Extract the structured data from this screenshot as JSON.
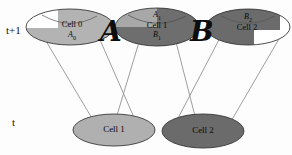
{
  "diagram": {
    "type": "cell-lineage-cone-diagram",
    "timeline": {
      "top_label": "t+1",
      "bottom_label": "t"
    },
    "operators": [
      {
        "id": "operator-a",
        "symbol": "A"
      },
      {
        "id": "operator-b",
        "symbol": "B"
      }
    ],
    "top_row": [
      {
        "id": "cell-0",
        "name": "Cell 0",
        "top_label": "",
        "bottom_label": "A",
        "bottom_label_sub": "0",
        "fill_left": "#ffffff",
        "fill_right": "#b3b3b3"
      },
      {
        "id": "cell-1-top",
        "name": "Cell 1",
        "top_label": "A",
        "top_label_sub": "1",
        "bottom_label": "B",
        "bottom_label_sub": "1",
        "fill_left": "#a8a8a8",
        "fill_right": "#6e6e6e"
      },
      {
        "id": "cell-2-top",
        "name": "Cell 2",
        "top_label": "B",
        "top_label_sub": "2",
        "bottom_label": "",
        "fill_left": "#6b6b6b",
        "fill_right": "#ffffff"
      }
    ],
    "bottom_row": [
      {
        "id": "cell-1-bottom",
        "name": "Cell 1",
        "fill": "#b0b0b0"
      },
      {
        "id": "cell-2-bottom",
        "name": "Cell 2",
        "fill": "#6b6b6b"
      }
    ],
    "colors": {
      "outline": "#3a3a3a",
      "cone_line": "#8c8c8c",
      "text": "#0a0a0a",
      "background": "#fdfdfd"
    }
  }
}
